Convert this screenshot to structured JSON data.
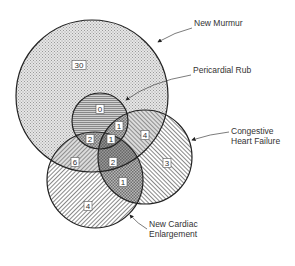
{
  "diagram": {
    "type": "venn",
    "sets": [
      {
        "id": "new_murmur",
        "label": "New Murmur",
        "cx": 92,
        "cy": 96,
        "r": 76
      },
      {
        "id": "pericardial_rub",
        "label": "Pericardial Rub",
        "cx": 100,
        "cy": 121,
        "r": 28
      },
      {
        "id": "chf",
        "label": "Congestive Heart Failure",
        "label_lines": [
          "Congestive",
          "Heart Failure"
        ],
        "cx": 145,
        "cy": 157,
        "r": 47
      },
      {
        "id": "nce",
        "label": "New Cardiac Enlargement",
        "label_lines": [
          "New Cardiac",
          "Enlargement"
        ],
        "cx": 95,
        "cy": 180,
        "r": 48
      }
    ],
    "regions": [
      {
        "sets": [
          "new_murmur"
        ],
        "value": "30",
        "x": 79,
        "y": 65
      },
      {
        "sets": [
          "new_murmur",
          "pericardial_rub"
        ],
        "value": "0",
        "x": 100,
        "y": 109
      },
      {
        "sets": [
          "new_murmur",
          "pericardial_rub",
          "chf"
        ],
        "value": "1",
        "x": 119,
        "y": 126
      },
      {
        "sets": [
          "new_murmur",
          "pericardial_rub",
          "nce"
        ],
        "value": "2",
        "x": 90,
        "y": 139
      },
      {
        "sets": [
          "new_murmur",
          "pericardial_rub",
          "chf",
          "nce"
        ],
        "value": "1",
        "x": 111,
        "y": 139
      },
      {
        "sets": [
          "new_murmur",
          "chf"
        ],
        "value": "4",
        "x": 145,
        "y": 135
      },
      {
        "sets": [
          "new_murmur",
          "nce"
        ],
        "value": "6",
        "x": 75,
        "y": 162
      },
      {
        "sets": [
          "new_murmur",
          "chf",
          "nce"
        ],
        "value": "2",
        "x": 113,
        "y": 162
      },
      {
        "sets": [
          "chf"
        ],
        "value": "3",
        "x": 167,
        "y": 163
      },
      {
        "sets": [
          "chf",
          "nce"
        ],
        "value": "1",
        "x": 123,
        "y": 182
      },
      {
        "sets": [
          "nce"
        ],
        "value": "4",
        "x": 88,
        "y": 206
      }
    ],
    "callouts": {
      "new_murmur": {
        "text": "New Murmur",
        "x": 194,
        "y": 23
      },
      "pericardial_rub": {
        "text": "Pericardial Rub",
        "x": 193,
        "y": 70
      },
      "chf": {
        "lines": [
          "Congestive",
          "Heart Failure"
        ],
        "x": 231,
        "y": 131
      },
      "nce": {
        "lines": [
          "New Cardiac",
          "Enlargement"
        ],
        "x": 149,
        "y": 224
      }
    },
    "colors": {
      "stroke": "#222222",
      "text": "#333333",
      "label_box": "#ffffff"
    }
  }
}
